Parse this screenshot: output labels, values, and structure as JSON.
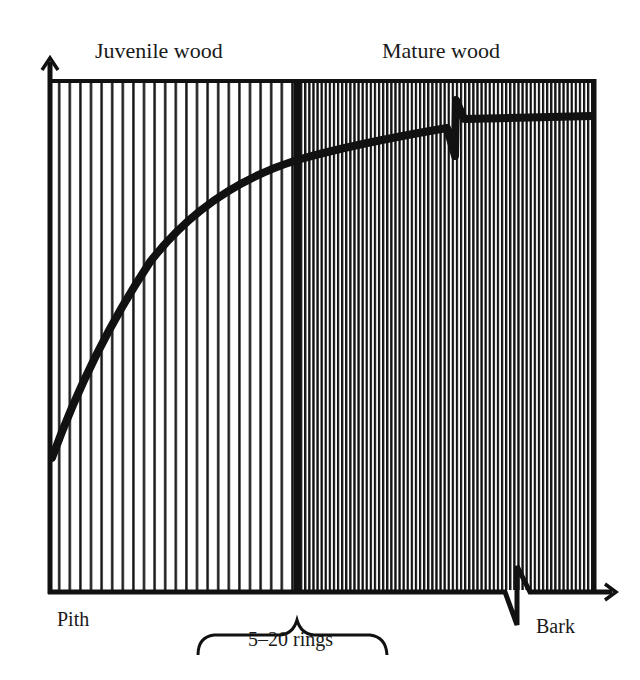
{
  "diagram": {
    "zones": [
      {
        "label": "Juvenile wood",
        "pattern": "widely spaced vertical lines",
        "x_start": 50,
        "x_end": 297
      },
      {
        "label": "Mature wood",
        "pattern": "densely spaced vertical lines",
        "x_start": 297,
        "x_end": 595
      }
    ],
    "axis_labels": {
      "x_start": "Pith",
      "x_end": "Bark"
    },
    "transition_annotation": "5–20 rings",
    "curve": {
      "description": "Property rises steeply in juvenile wood, then levels off in mature wood",
      "points": [
        [
          52,
          458
        ],
        [
          100,
          340
        ],
        [
          150,
          262
        ],
        [
          200,
          207
        ],
        [
          250,
          177
        ],
        [
          297,
          160
        ],
        [
          350,
          146
        ],
        [
          400,
          136
        ],
        [
          447,
          128
        ]
      ],
      "after_break_points": [
        [
          462,
          120
        ],
        [
          520,
          118
        ],
        [
          592,
          116
        ]
      ]
    },
    "colors": {
      "ink": "#111111",
      "background": "#ffffff"
    }
  }
}
